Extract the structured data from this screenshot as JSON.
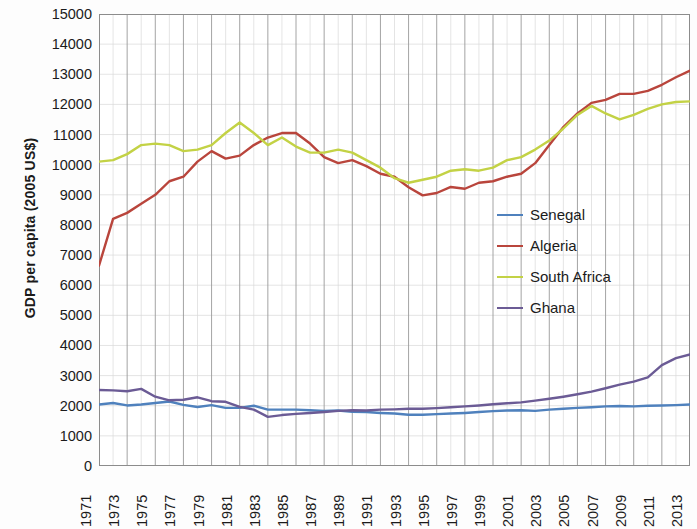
{
  "chart_data": {
    "type": "line",
    "title": "",
    "xlabel": "",
    "ylabel": "GDP per capita (2005 US$)",
    "ylim": [
      0,
      15000
    ],
    "ytick_step": 1000,
    "yticks": [
      "15000",
      "14000",
      "13000",
      "12000",
      "11000",
      "10000",
      "9000",
      "8000",
      "7000",
      "6000",
      "5000",
      "4000",
      "3000",
      "2000",
      "1000",
      "0"
    ],
    "xlim": [
      1971,
      2013
    ],
    "xticks": [
      "1971",
      "1973",
      "1975",
      "1977",
      "1979",
      "1981",
      "1983",
      "1985",
      "1987",
      "1989",
      "1991",
      "1993",
      "1995",
      "1997",
      "1999",
      "2001",
      "2003",
      "2005",
      "2007",
      "2009",
      "2011",
      "2013"
    ],
    "x": [
      1971,
      1972,
      1973,
      1974,
      1975,
      1976,
      1977,
      1978,
      1979,
      1980,
      1981,
      1982,
      1983,
      1984,
      1985,
      1986,
      1987,
      1988,
      1989,
      1990,
      1991,
      1992,
      1993,
      1994,
      1995,
      1996,
      1997,
      1998,
      1999,
      2000,
      2001,
      2002,
      2003,
      2004,
      2005,
      2006,
      2007,
      2008,
      2009,
      2010,
      2011,
      2012,
      2013
    ],
    "grid": "both",
    "legend_position": "right-middle",
    "series": [
      {
        "name": "Senegal",
        "color": "#4f81bd",
        "values": [
          2040,
          2090,
          2010,
          2040,
          2090,
          2140,
          2030,
          1960,
          2020,
          1930,
          1930,
          2000,
          1870,
          1870,
          1870,
          1850,
          1830,
          1840,
          1800,
          1790,
          1760,
          1740,
          1700,
          1700,
          1720,
          1740,
          1760,
          1790,
          1820,
          1840,
          1850,
          1830,
          1870,
          1900,
          1930,
          1950,
          1980,
          1990,
          1980,
          2000,
          2010,
          2020,
          2040
        ]
      },
      {
        "name": "Algeria",
        "color": "#b9453c",
        "values": [
          6650,
          8200,
          8400,
          8700,
          9000,
          9450,
          9600,
          10100,
          10450,
          10200,
          10300,
          10650,
          10900,
          11050,
          11050,
          10700,
          10250,
          10050,
          10150,
          9950,
          9700,
          9600,
          9250,
          8980,
          9060,
          9260,
          9200,
          9400,
          9450,
          9600,
          9700,
          10050,
          10650,
          11250,
          11700,
          12050,
          12150,
          12350,
          12350,
          12450,
          12650,
          12900,
          13120
        ]
      },
      {
        "name": "South Africa",
        "color": "#c3d245",
        "values": [
          10100,
          10150,
          10350,
          10650,
          10700,
          10650,
          10450,
          10500,
          10650,
          11050,
          11400,
          11050,
          10650,
          10900,
          10600,
          10400,
          10400,
          10500,
          10400,
          10150,
          9900,
          9550,
          9400,
          9500,
          9600,
          9800,
          9850,
          9800,
          9900,
          10150,
          10250,
          10500,
          10800,
          11200,
          11650,
          11950,
          11700,
          11500,
          11650,
          11850,
          12000,
          12080,
          12100
        ]
      },
      {
        "name": "Ghana",
        "color": "#6b5b95",
        "values": [
          2520,
          2510,
          2480,
          2560,
          2300,
          2180,
          2200,
          2280,
          2150,
          2130,
          1960,
          1870,
          1630,
          1690,
          1730,
          1760,
          1790,
          1830,
          1850,
          1840,
          1870,
          1880,
          1900,
          1900,
          1920,
          1950,
          1980,
          2010,
          2050,
          2080,
          2110,
          2170,
          2230,
          2300,
          2380,
          2470,
          2580,
          2700,
          2800,
          2940,
          3350,
          3580,
          3700
        ]
      }
    ]
  },
  "legend": {
    "items": [
      {
        "label": "Senegal",
        "color": "#4f81bd"
      },
      {
        "label": "Algeria",
        "color": "#b9453c"
      },
      {
        "label": "South Africa",
        "color": "#c3d245"
      },
      {
        "label": "Ghana",
        "color": "#6b5b95"
      }
    ]
  }
}
